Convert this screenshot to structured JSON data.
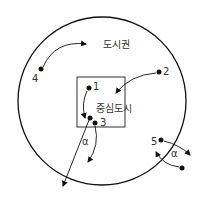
{
  "diagram": {
    "region_label": "도시권",
    "center_label": "중심도시",
    "alpha_symbol": "α",
    "points": [
      {
        "id": "1",
        "label": "1"
      },
      {
        "id": "2",
        "label": "2"
      },
      {
        "id": "3",
        "label": "3"
      },
      {
        "id": "4",
        "label": "4"
      },
      {
        "id": "5",
        "label": "5"
      }
    ],
    "colors": {
      "stroke": "#111111",
      "text": "#333333",
      "background": "#ffffff"
    }
  }
}
